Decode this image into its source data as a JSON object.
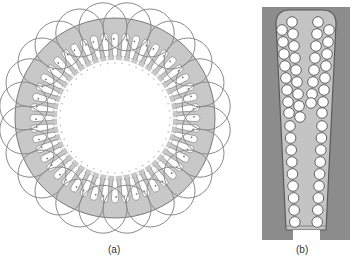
{
  "figure": {
    "panels": [
      {
        "id": "a",
        "caption": "(a)",
        "description": "Stator lamination with distributed concentric winding end-turn loops",
        "slot_count": 48,
        "loop_count": 24,
        "colors": {
          "core": "#c8c8c8",
          "outline": "#7a7a7a",
          "slot": "#ffffff",
          "loop": "#8a8a8a"
        }
      },
      {
        "id": "b",
        "caption": "(b)",
        "description": "Single stator slot cross-section with round conductors in two layers",
        "conductors_left_column": 18,
        "conductors_right_column": 17,
        "colors": {
          "frame": "#8c8c8c",
          "slot_fill": "#c4c4c4",
          "conductor": "#ffffff",
          "conductor_outline": "#555555"
        }
      }
    ]
  }
}
